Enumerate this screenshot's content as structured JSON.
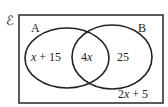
{
  "diagram": {
    "type": "venn",
    "universal_symbol": "ℰ",
    "sets": [
      {
        "name": "A",
        "label": "A"
      },
      {
        "name": "B",
        "label": "B"
      }
    ],
    "regions": {
      "a_only": {
        "var": "x",
        "rest": " + 15"
      },
      "intersection": {
        "coef": "4",
        "var": "x"
      },
      "b_only": "25",
      "outside": {
        "coef": "2",
        "var": "x",
        "rest": " + 5"
      }
    },
    "colors": {
      "stroke": "#222222",
      "background": "#ffffff"
    }
  }
}
